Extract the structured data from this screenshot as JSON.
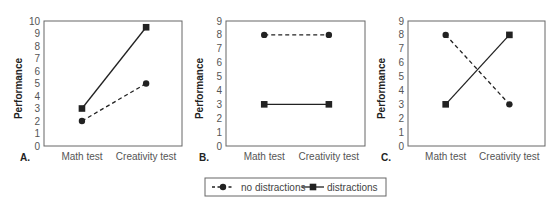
{
  "chart_data": [
    {
      "type": "line",
      "panel_label": "A.",
      "title": "",
      "xlabel": "",
      "ylabel": "Performance",
      "categories": [
        "Math test",
        "Creativity test"
      ],
      "ylim": [
        0,
        10
      ],
      "yticks": [
        0,
        1,
        2,
        3,
        4,
        5,
        6,
        7,
        8,
        9,
        10
      ],
      "grid": false,
      "series": [
        {
          "name": "no distractions",
          "style": "dashed",
          "marker": "circle",
          "values": [
            2,
            5
          ]
        },
        {
          "name": "distractions",
          "style": "solid",
          "marker": "square",
          "values": [
            3,
            9.5
          ]
        }
      ]
    },
    {
      "type": "line",
      "panel_label": "B.",
      "title": "",
      "xlabel": "",
      "ylabel": "Performance",
      "categories": [
        "Math test",
        "Creativity test"
      ],
      "ylim": [
        0,
        9
      ],
      "yticks": [
        0,
        1,
        2,
        3,
        4,
        5,
        6,
        7,
        8,
        9
      ],
      "grid": false,
      "series": [
        {
          "name": "no distractions",
          "style": "dashed",
          "marker": "circle",
          "values": [
            8,
            8
          ]
        },
        {
          "name": "distractions",
          "style": "solid",
          "marker": "square",
          "values": [
            3,
            3
          ]
        }
      ]
    },
    {
      "type": "line",
      "panel_label": "C.",
      "title": "",
      "xlabel": "",
      "ylabel": "Performance",
      "categories": [
        "Math test",
        "Creativity test"
      ],
      "ylim": [
        0,
        9
      ],
      "yticks": [
        0,
        1,
        2,
        3,
        4,
        5,
        6,
        7,
        8,
        9
      ],
      "grid": false,
      "series": [
        {
          "name": "no distractions",
          "style": "dashed",
          "marker": "circle",
          "values": [
            8,
            3
          ]
        },
        {
          "name": "distractions",
          "style": "solid",
          "marker": "square",
          "values": [
            3,
            8
          ]
        }
      ]
    }
  ],
  "legend": {
    "placement": "bottom-center",
    "entries": [
      {
        "label": "no distractions",
        "style": "dashed",
        "marker": "circle"
      },
      {
        "label": "distractions",
        "style": "solid",
        "marker": "square"
      }
    ]
  },
  "colors": {
    "line": "#222222",
    "axis": "#666666"
  }
}
